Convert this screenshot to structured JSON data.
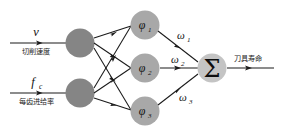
{
  "diagram": {
    "type": "neural-network",
    "title_visible": false,
    "background_color": "#ffffff",
    "colors": {
      "input_node": "#858585",
      "hidden_node": "#a8a8a8",
      "sum_node": "#c4c4c4",
      "edge": "#1a1a1a",
      "text": "#111111"
    },
    "inputs": [
      {
        "symbol": "v",
        "subscript": "",
        "caption": "切削速度",
        "node_name": "input-node-cutting-speed"
      },
      {
        "symbol": "f",
        "subscript": "c",
        "caption": "每齿进给率",
        "node_name": "input-node-feed-per-tooth"
      }
    ],
    "hidden_layer": [
      {
        "symbol": "φ",
        "subscript": "1"
      },
      {
        "symbol": "φ",
        "subscript": "2"
      },
      {
        "symbol": "φ",
        "subscript": "3"
      }
    ],
    "weights": [
      {
        "symbol": "ω",
        "subscript": "1"
      },
      {
        "symbol": "ω",
        "subscript": "2"
      },
      {
        "symbol": "ω",
        "subscript": "3"
      }
    ],
    "sum_node": {
      "symbol": "Σ"
    },
    "output": {
      "caption": "刀具寿命"
    }
  }
}
